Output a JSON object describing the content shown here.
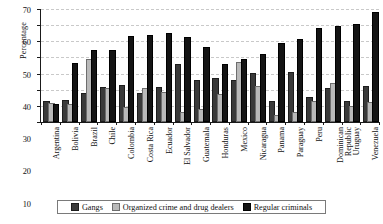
{
  "chart_data": {
    "type": "bar",
    "title": "",
    "xlabel": "",
    "ylabel": "Percentage",
    "ylim": [
      0,
      70
    ],
    "yticks": [
      0,
      10,
      20,
      30,
      40,
      50,
      60,
      70
    ],
    "grid": true,
    "legend_position": "bottom",
    "categories": [
      "Argentina",
      "Bolivia",
      "Brazil",
      "Chile",
      "Colombia",
      "Costa Rica",
      "Ecuador",
      "El Salvador",
      "Guatemala",
      "Honduras",
      "Mexico",
      "Nicaragua",
      "Panama",
      "Paraguay",
      "Peru",
      "Dominican Republic",
      "Uruguay",
      "Venezuela"
    ],
    "series": [
      {
        "name": "Gangs",
        "color": "#3a3a3a",
        "values": [
          12,
          12.5,
          17,
          20.5,
          21.5,
          16.5,
          20.5,
          35,
          24.5,
          26,
          25,
          29,
          12,
          30,
          14.5,
          20,
          12,
          21
        ]
      },
      {
        "name": "Organized crime and drug dealers",
        "color": "#b9b9b9",
        "values": [
          10.5,
          10,
          37.5,
          20,
          8,
          20,
          17.5,
          5,
          7,
          16,
          36,
          21,
          3,
          5,
          11.5,
          23,
          8.5,
          11
        ]
      },
      {
        "name": "Regular criminals",
        "color": "#141414",
        "values": [
          10,
          35.5,
          43.5,
          43.5,
          52,
          52.5,
          54,
          51.5,
          45,
          35,
          38,
          41,
          48,
          50,
          57,
          58,
          59.5,
          67
        ]
      }
    ]
  },
  "legend": {
    "items": [
      {
        "label": "Gangs"
      },
      {
        "label": "Organized crime and drug dealers"
      },
      {
        "label": "Regular criminals"
      }
    ]
  }
}
